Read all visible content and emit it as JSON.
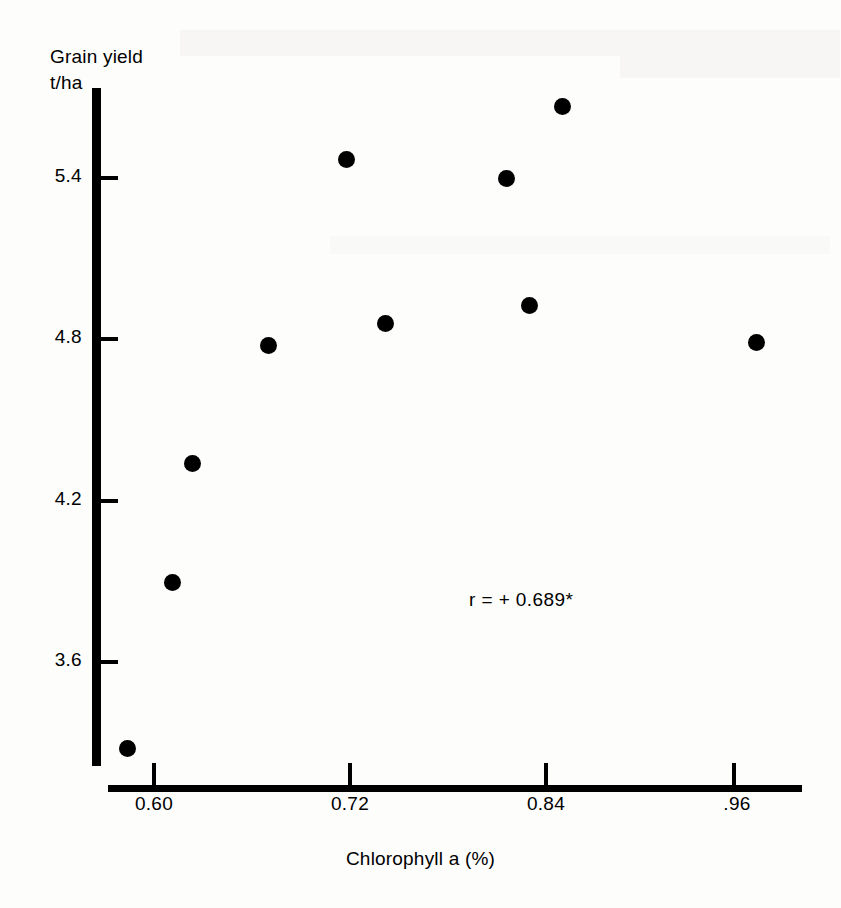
{
  "chart_data": {
    "type": "scatter",
    "title": "",
    "xlabel": "Chlorophyll a (%)",
    "ylabel": "Grain yield\nt/ha",
    "ylabel_lines": [
      "Grain yield",
      "t/ha"
    ],
    "xlim": [
      0.5715,
      0.9975
    ],
    "ylim": [
      3.21,
      5.76
    ],
    "grid": false,
    "legend": null,
    "xticks": [
      0.6,
      0.72,
      0.84,
      0.96
    ],
    "xtick_labels": [
      "0.60",
      "0.72",
      "0.84",
      ".96"
    ],
    "yticks": [
      3.6,
      4.2,
      4.8,
      5.4
    ],
    "ytick_labels": [
      "3.6",
      "4.2",
      "4.8",
      "5.4"
    ],
    "marker": "filled-circle",
    "marker_color": "#000000",
    "points": [
      {
        "x": 0.585,
        "y": 3.27
      },
      {
        "x": 0.613,
        "y": 3.89
      },
      {
        "x": 0.625,
        "y": 4.33
      },
      {
        "x": 0.672,
        "y": 4.77
      },
      {
        "x": 0.721,
        "y": 5.46
      },
      {
        "x": 0.745,
        "y": 4.85
      },
      {
        "x": 0.82,
        "y": 5.39
      },
      {
        "x": 0.834,
        "y": 4.92
      },
      {
        "x": 0.855,
        "y": 5.66
      },
      {
        "x": 0.975,
        "y": 4.78
      }
    ],
    "annotations": [
      {
        "text": "r = + 0.689*",
        "x": 0.862,
        "y": 3.82
      }
    ]
  },
  "axes": {
    "y_title_text": "Grain yield\nt/ha",
    "x_title_text": "Chlorophyll a (%)"
  },
  "annotation": {
    "correlation_text": "r = + 0.689*"
  },
  "colors": {
    "ink": "#000000",
    "paper": "#fdfdfc"
  }
}
